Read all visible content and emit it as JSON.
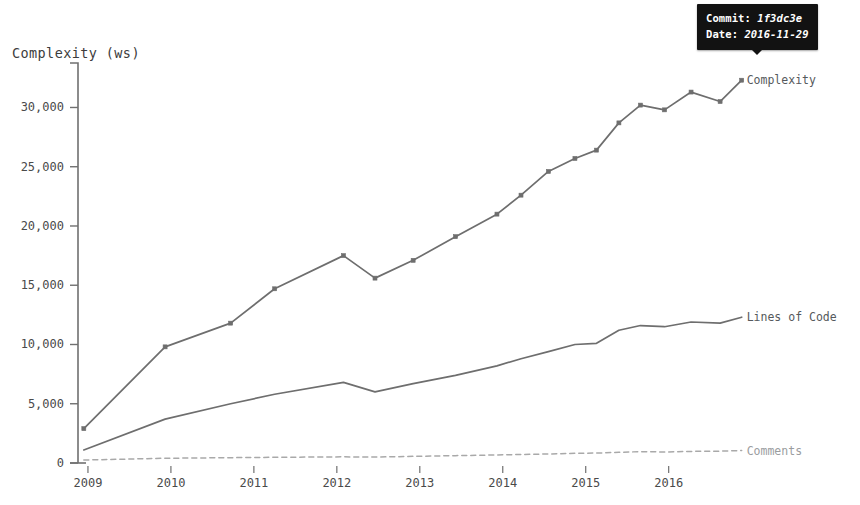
{
  "chart_data": {
    "type": "line",
    "title": "Complexity (ws)",
    "xlabel": "",
    "ylabel": "Complexity (ws)",
    "xlim": [
      2008.88,
      2016.92
    ],
    "ylim": [
      0,
      33500
    ],
    "grid": false,
    "legend_position": "right-of-plot-end",
    "y_ticks": [
      0,
      5000,
      10000,
      15000,
      20000,
      25000,
      30000
    ],
    "y_tick_labels": [
      "0",
      "5,000",
      "10,000",
      "15,000",
      "20,000",
      "25,000",
      "30,000"
    ],
    "x_ticks": [
      2009,
      2010,
      2011,
      2012,
      2013,
      2014,
      2015,
      2016
    ],
    "x_tick_labels": [
      "2009",
      "2010",
      "2011",
      "2012",
      "2013",
      "2014",
      "2015",
      "2016"
    ],
    "series": [
      {
        "name": "Complexity",
        "color": "#6e6e6e",
        "style": "solid",
        "markers": true,
        "x": [
          2008.95,
          2009.93,
          2010.72,
          2011.25,
          2012.08,
          2012.46,
          2012.92,
          2013.43,
          2013.93,
          2014.22,
          2014.55,
          2014.87,
          2015.13,
          2015.4,
          2015.66,
          2015.95,
          2016.27,
          2016.62,
          2016.88
        ],
        "values": [
          2900,
          9800,
          11800,
          14700,
          17500,
          15600,
          17100,
          19100,
          21000,
          22600,
          24600,
          25700,
          26400,
          28700,
          30200,
          29800,
          31300,
          30500,
          32300
        ]
      },
      {
        "name": "Lines of Code",
        "color": "#6e6e6e",
        "style": "solid",
        "markers": false,
        "x": [
          2008.95,
          2009.93,
          2010.72,
          2011.25,
          2012.08,
          2012.46,
          2012.92,
          2013.43,
          2013.93,
          2014.22,
          2014.55,
          2014.87,
          2015.13,
          2015.4,
          2015.66,
          2015.95,
          2016.27,
          2016.62,
          2016.88
        ],
        "values": [
          1100,
          3700,
          5000,
          5800,
          6800,
          6000,
          6700,
          7400,
          8200,
          8800,
          9400,
          10000,
          10100,
          11200,
          11600,
          11500,
          11900,
          11800,
          12300
        ]
      },
      {
        "name": "Comments",
        "color": "#a9a9a9",
        "style": "dashed",
        "markers": false,
        "x": [
          2008.95,
          2009.93,
          2010.72,
          2011.25,
          2012.08,
          2012.46,
          2012.92,
          2013.43,
          2013.93,
          2014.22,
          2014.55,
          2014.87,
          2015.13,
          2015.4,
          2015.66,
          2015.95,
          2016.27,
          2016.62,
          2016.88
        ],
        "values": [
          250,
          400,
          450,
          480,
          520,
          500,
          560,
          620,
          680,
          720,
          760,
          820,
          840,
          900,
          960,
          930,
          980,
          1000,
          1050
        ]
      }
    ]
  },
  "tooltip": {
    "commit_key": "Commit:",
    "commit_value": "1f3dc3e",
    "date_key": "Date:",
    "date_value": "2016-11-29"
  }
}
